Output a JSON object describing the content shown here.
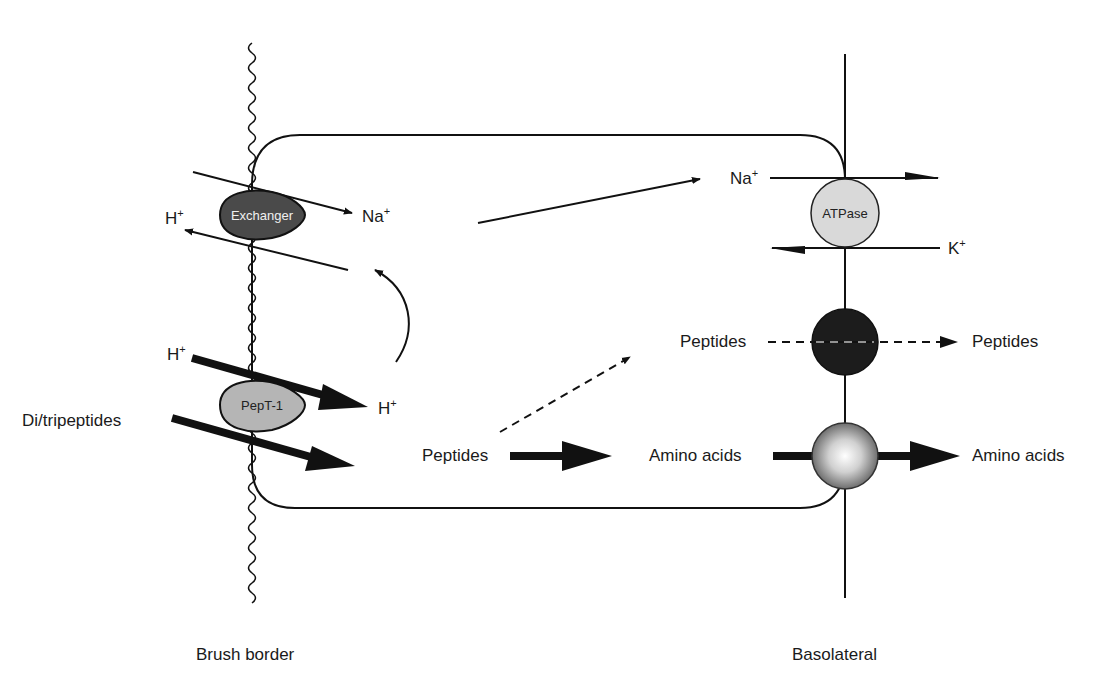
{
  "membranes": {
    "apical_label": "Brush border",
    "basolateral_label": "Basolateral"
  },
  "transporters": {
    "exchanger": {
      "label": "Exchanger",
      "color": "#4a4a4a"
    },
    "pept1": {
      "label": "PepT-1",
      "color": "#b5b5b5"
    },
    "atpase": {
      "label": "ATPase",
      "color": "#d9d9d9"
    },
    "peptide_carrier": {
      "color": "#1c1c1c"
    },
    "amino_acid_carrier": {
      "color": "#9a9a9a"
    }
  },
  "ions": {
    "h_exchanger": "H",
    "na_exchanger": "Na",
    "h_pept_in": "H",
    "h_pept_out": "H",
    "na_atpase": "Na",
    "k_atpase": "K",
    "plus": "+"
  },
  "substrates": {
    "di_tripeptides": "Di/tripeptides",
    "peptides_cell": "Peptides",
    "peptides_baso_in": "Peptides",
    "peptides_baso_out": "Peptides",
    "amino_acids_in": "Amino acids",
    "amino_acids_out": "Amino acids"
  }
}
